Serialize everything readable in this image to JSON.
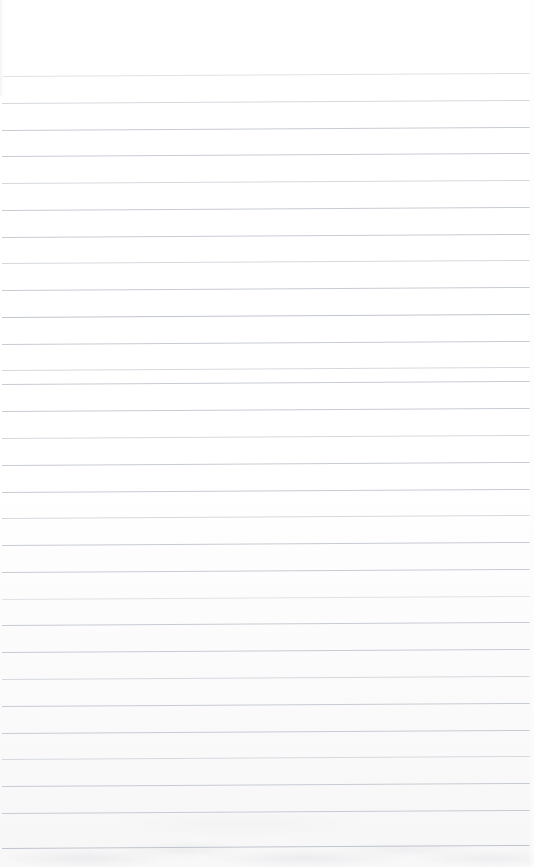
{
  "document": {
    "kind": "ruled-notebook-paper",
    "title": "Blank ruled notebook page",
    "has_text": false,
    "page_number": "",
    "visible_text": []
  },
  "paper": {
    "width_px": 534,
    "height_px": 867,
    "background_color": "#ffffff",
    "bottom_edge_tint": "#f7f7f8"
  },
  "ruling": {
    "line_color": "#c7ccd3",
    "line_color_faint": "#d5d9de",
    "line_color_fainter": "#dfe2e6",
    "line_color_strong": "#bfc5cd",
    "line_thickness_px": 1,
    "line_spacing_px": 26.8,
    "first_line_y_px": 76,
    "last_line_y_px": 848,
    "line_start_x_px": 2,
    "line_end_x_px": 530,
    "line_count": 30,
    "tilt_degrees": -0.33,
    "margin_rule": "none",
    "lines": [
      {
        "y": 76,
        "weight": "fainter"
      },
      {
        "y": 103,
        "weight": "faint"
      },
      {
        "y": 130,
        "weight": "normal"
      },
      {
        "y": 156,
        "weight": "normal"
      },
      {
        "y": 183,
        "weight": "faint"
      },
      {
        "y": 210,
        "weight": "normal"
      },
      {
        "y": 237,
        "weight": "normal"
      },
      {
        "y": 263,
        "weight": "faint"
      },
      {
        "y": 290,
        "weight": "normal"
      },
      {
        "y": 317,
        "weight": "strong"
      },
      {
        "y": 344,
        "weight": "normal"
      },
      {
        "y": 370,
        "weight": "faint"
      },
      {
        "y": 384,
        "weight": "normal"
      },
      {
        "y": 411,
        "weight": "normal"
      },
      {
        "y": 438,
        "weight": "faint"
      },
      {
        "y": 465,
        "weight": "normal"
      },
      {
        "y": 492,
        "weight": "normal"
      },
      {
        "y": 518,
        "weight": "faint"
      },
      {
        "y": 545,
        "weight": "normal"
      },
      {
        "y": 572,
        "weight": "normal"
      },
      {
        "y": 599,
        "weight": "fainter"
      },
      {
        "y": 625,
        "weight": "normal"
      },
      {
        "y": 652,
        "weight": "normal"
      },
      {
        "y": 679,
        "weight": "faint"
      },
      {
        "y": 706,
        "weight": "normal"
      },
      {
        "y": 733,
        "weight": "normal"
      },
      {
        "y": 759,
        "weight": "faint"
      },
      {
        "y": 786,
        "weight": "normal"
      },
      {
        "y": 813,
        "weight": "normal"
      },
      {
        "y": 848,
        "weight": "strong"
      }
    ]
  }
}
